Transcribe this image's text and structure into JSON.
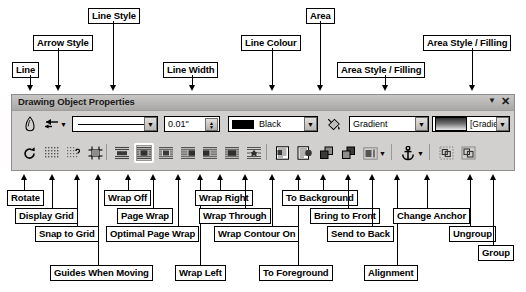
{
  "window": {
    "title": "Drawing Object Properties",
    "menu_icon": "chevron-down-icon",
    "close_icon": "close-icon"
  },
  "toolbar_row1": {
    "line_button": "line-icon",
    "arrow_style_button": "arrow-style-icon",
    "arrow_style_dropdown": "chevron-down-icon",
    "line_style_value": "",
    "line_width_value": "0.01\"",
    "line_colour_value": "Black",
    "area_button": "area-fill-icon",
    "area_style_value": "Gradient",
    "area_filling_value": "[Gradient 7"
  },
  "toolbar_row2": {
    "items": [
      {
        "name": "rotate",
        "icon": "rotate-icon"
      },
      {
        "name": "display-grid",
        "icon": "grid-icon"
      },
      {
        "name": "snap-to-grid",
        "icon": "snap-grid-icon"
      },
      {
        "name": "guides-when-moving",
        "icon": "guides-icon"
      },
      {
        "name": "wrap-off",
        "icon": "wrap-off-icon"
      },
      {
        "name": "page-wrap",
        "icon": "page-wrap-icon"
      },
      {
        "name": "optimal-page-wrap",
        "icon": "optimal-wrap-icon"
      },
      {
        "name": "wrap-left",
        "icon": "wrap-left-icon"
      },
      {
        "name": "wrap-right",
        "icon": "wrap-right-icon"
      },
      {
        "name": "wrap-through",
        "icon": "wrap-through-icon"
      },
      {
        "name": "wrap-contour-on",
        "icon": "wrap-contour-icon"
      },
      {
        "name": "to-foreground",
        "icon": "to-foreground-icon"
      },
      {
        "name": "to-background",
        "icon": "to-background-icon"
      },
      {
        "name": "bring-to-front",
        "icon": "bring-front-icon"
      },
      {
        "name": "send-to-back",
        "icon": "send-back-icon"
      },
      {
        "name": "alignment",
        "icon": "alignment-icon"
      },
      {
        "name": "alignment-dropdown",
        "icon": "chevron-down-icon"
      },
      {
        "name": "change-anchor",
        "icon": "anchor-icon"
      },
      {
        "name": "change-anchor-dropdown",
        "icon": "chevron-down-icon"
      },
      {
        "name": "ungroup",
        "icon": "ungroup-icon"
      },
      {
        "name": "group",
        "icon": "group-icon"
      }
    ]
  },
  "callouts_top": [
    {
      "id": "line",
      "label": "Line"
    },
    {
      "id": "arrow-style",
      "label": "Arrow Style"
    },
    {
      "id": "line-style",
      "label": "Line Style"
    },
    {
      "id": "line-width",
      "label": "Line Width"
    },
    {
      "id": "line-colour",
      "label": "Line Colour"
    },
    {
      "id": "area",
      "label": "Area"
    },
    {
      "id": "area-style-filling-1",
      "label": "Area Style / Filling"
    },
    {
      "id": "area-style-filling-2",
      "label": "Area Style / Filling"
    }
  ],
  "callouts_bottom": [
    {
      "id": "rotate",
      "label": "Rotate"
    },
    {
      "id": "display-grid",
      "label": "Display Grid"
    },
    {
      "id": "snap-to-grid",
      "label": "Snap to Grid"
    },
    {
      "id": "guides-when-moving",
      "label": "Guides When Moving"
    },
    {
      "id": "wrap-off",
      "label": "Wrap Off"
    },
    {
      "id": "page-wrap",
      "label": "Page Wrap"
    },
    {
      "id": "optimal-page-wrap",
      "label": "Optimal Page Wrap"
    },
    {
      "id": "wrap-left",
      "label": "Wrap Left"
    },
    {
      "id": "wrap-right",
      "label": "Wrap Right"
    },
    {
      "id": "wrap-through",
      "label": "Wrap Through"
    },
    {
      "id": "wrap-contour-on",
      "label": "Wrap Contour On"
    },
    {
      "id": "to-foreground",
      "label": "To Foreground"
    },
    {
      "id": "to-background",
      "label": "To Background"
    },
    {
      "id": "bring-to-front",
      "label": "Bring to Front"
    },
    {
      "id": "send-to-back",
      "label": "Send to Back"
    },
    {
      "id": "alignment",
      "label": "Alignment"
    },
    {
      "id": "change-anchor",
      "label": "Change Anchor"
    },
    {
      "id": "ungroup",
      "label": "Ungroup"
    },
    {
      "id": "group",
      "label": "Group"
    }
  ],
  "colors": {
    "toolbar_bg": "#d2d0ce",
    "titlebar_bg": "#b8b6b4",
    "line_colour_swatch": "#000000",
    "callout_border": "#000000",
    "callout_bg": "#ffffff"
  }
}
